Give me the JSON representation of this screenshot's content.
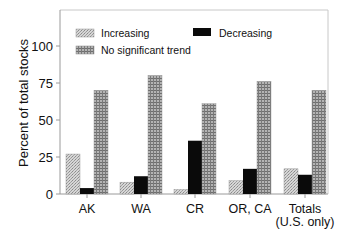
{
  "chart_data": {
    "type": "bar",
    "title": "",
    "xlabel": "",
    "ylabel": "Percent of total stocks",
    "ylim": [
      0,
      125
    ],
    "yticks": [
      0,
      25,
      50,
      75,
      100
    ],
    "grid": false,
    "legend_position": "top-inside",
    "categories": [
      "AK",
      "WA",
      "CR",
      "OR, CA",
      "Totals\n(U.S. only)"
    ],
    "category_labels": [
      [
        "AK"
      ],
      [
        "WA"
      ],
      [
        "CR"
      ],
      [
        "OR, CA"
      ],
      [
        "Totals",
        "(U.S. only)"
      ]
    ],
    "series": [
      {
        "name": "Increasing",
        "pattern": "stipple-light",
        "color": "#c8c8c8",
        "values": [
          27,
          8,
          3,
          9,
          17
        ]
      },
      {
        "name": "Decreasing",
        "pattern": "solid",
        "color": "#0a0a0a",
        "values": [
          4,
          12,
          36,
          17,
          13
        ]
      },
      {
        "name": "No significant trend",
        "pattern": "grid",
        "color": "#9a9a9a",
        "values": [
          70,
          80,
          61,
          76,
          70
        ]
      }
    ]
  },
  "legend": {
    "items": [
      "Increasing",
      "Decreasing",
      "No significant trend"
    ]
  }
}
